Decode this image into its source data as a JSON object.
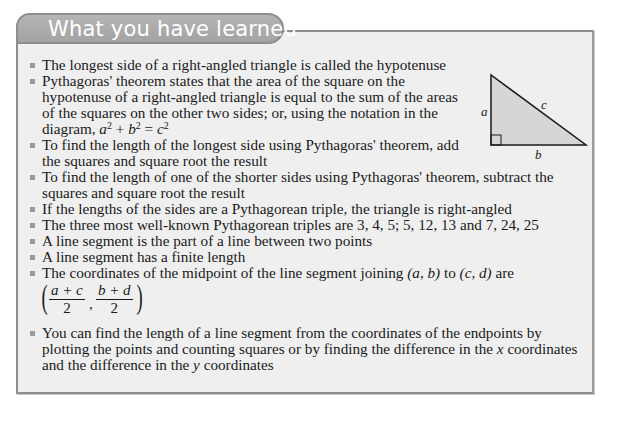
{
  "header": {
    "title": "What you have learned"
  },
  "diagram": {
    "label_a": "a",
    "label_b": "b",
    "label_c": "c",
    "fill_color": "#d6d6d6",
    "stroke_color": "#1a1a1a"
  },
  "colors": {
    "box_background": "#efefef",
    "box_border": "#8e8e8e",
    "tab_fill": "#a8a8a8",
    "tab_text": "#ffffff",
    "bullet": "#9a9a9a",
    "body_text": "#1a1a1a"
  },
  "bullets": [
    {
      "text": "The longest side of a right-angled triangle is called the hypotenuse"
    },
    {
      "text_before": "Pythagoras' theorem states that the area of the square on the hypotenuse of a right-angled triangle is equal to the sum of the areas of the squares on the other two sides; or, using the notation in the diagram, ",
      "eq_a": "a",
      "eq_plus": " + ",
      "eq_b": "b",
      "eq_eq": " = ",
      "eq_c": "c",
      "exp": "2"
    },
    {
      "text": "To find the length of the longest side using Pythagoras' theorem, add the squares and square root the result"
    },
    {
      "text": "To find the length of one of the shorter sides using Pythagoras' theorem, subtract the squares and square root the result"
    },
    {
      "text": "If the lengths of the sides are a Pythagorean triple, the triangle is right-angled"
    },
    {
      "text": "The three most well-known Pythagorean triples are 3, 4, 5; 5, 12, 13 and 7, 24, 25"
    },
    {
      "text": "A line segment is the part of a line between two points"
    },
    {
      "text": "A line segment has a finite length"
    },
    {
      "text_before": "The coordinates of the midpoint of the line segment joining ",
      "point1": "(a, b)",
      "text_mid": " to ",
      "point2": "(c, d)",
      "text_after": " are",
      "frac1_num": "a + c",
      "frac1_den": "2",
      "frac2_num": "b + d",
      "frac2_den": "2",
      "paren_open": "(",
      "paren_close": ")",
      "comma": ","
    },
    {
      "text_before": "You can find the length of a line segment from the coordinates of the endpoints by plotting the points and counting squares or by finding the difference in the ",
      "var_x": "x",
      "text_mid": " coordinates and the difference in the ",
      "var_y": "y",
      "text_after": " coordinates"
    }
  ]
}
